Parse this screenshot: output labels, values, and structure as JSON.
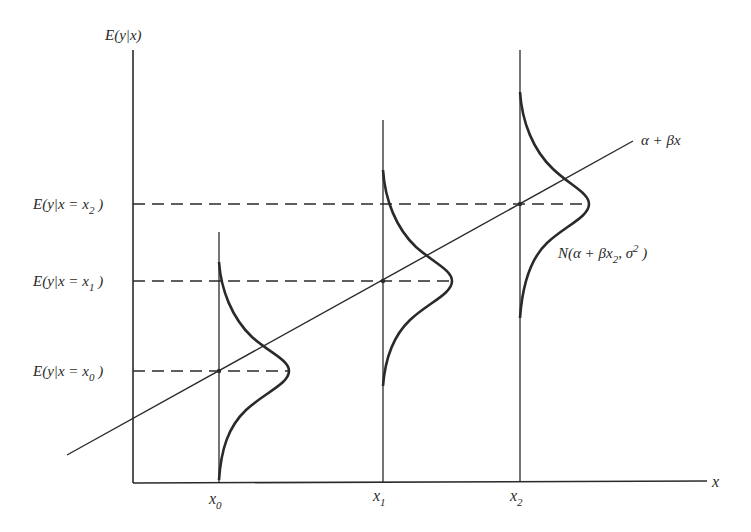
{
  "diagram": {
    "y_axis_label": {
      "main": "E(y|x)"
    },
    "x_axis_label": "x",
    "regression_line_label": "α + βx",
    "distribution_label": {
      "prefix": "N(α + βx",
      "sub": "2",
      "mid": ", σ",
      "sup": "2",
      "suffix": " )"
    },
    "x_ticks": [
      {
        "name": "x",
        "sub": "0"
      },
      {
        "name": "x",
        "sub": "1"
      },
      {
        "name": "x",
        "sub": "2"
      }
    ],
    "conditional_means": [
      {
        "prefix": "E(y|x = x",
        "sub": "0",
        "suffix": " )"
      },
      {
        "prefix": "E(y|x = x",
        "sub": "1",
        "suffix": " )"
      },
      {
        "prefix": "E(y|x = x",
        "sub": "2",
        "suffix": " )"
      }
    ],
    "colors": {
      "ink": "#2a2a2a",
      "background": "#ffffff"
    }
  }
}
